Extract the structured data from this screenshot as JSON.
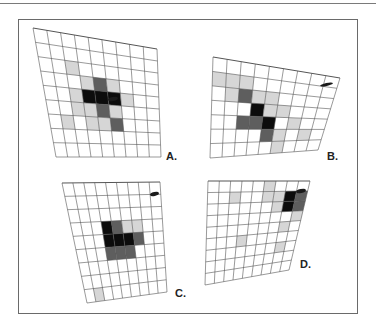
{
  "figure": {
    "panels": [
      {
        "id": "A",
        "label": "A.",
        "cols": 9,
        "rows": 9,
        "corners": {
          "tl": [
            33,
            28
          ],
          "tr": [
            157,
            49
          ],
          "br": [
            161,
            157
          ],
          "bl": [
            56,
            157
          ]
        },
        "label_pos": [
          166,
          150
        ],
        "cells": [
          [
            2,
            2,
            1
          ],
          [
            3,
            3,
            1
          ],
          [
            3,
            4,
            2
          ],
          [
            3,
            5,
            1
          ],
          [
            4,
            2,
            1
          ],
          [
            4,
            3,
            3
          ],
          [
            4,
            4,
            3
          ],
          [
            4,
            5,
            3
          ],
          [
            4,
            6,
            1
          ],
          [
            5,
            2,
            1
          ],
          [
            5,
            3,
            1
          ],
          [
            5,
            4,
            2
          ],
          [
            5,
            5,
            1
          ],
          [
            6,
            1,
            1
          ],
          [
            6,
            3,
            1
          ],
          [
            6,
            4,
            1
          ],
          [
            6,
            5,
            2
          ]
        ],
        "marker": {
          "x": 108,
          "y": 97,
          "w": 10,
          "h": 4
        }
      },
      {
        "id": "B",
        "label": "B.",
        "cols": 9,
        "rows": 7,
        "corners": {
          "tl": [
            213,
            57
          ],
          "tr": [
            340,
            78
          ],
          "br": [
            318,
            150
          ],
          "bl": [
            210,
            158
          ]
        },
        "label_pos": [
          327,
          150
        ],
        "cells": [
          [
            1,
            0,
            1
          ],
          [
            1,
            1,
            1
          ],
          [
            1,
            2,
            1
          ],
          [
            2,
            1,
            1
          ],
          [
            2,
            2,
            2
          ],
          [
            2,
            3,
            1
          ],
          [
            2,
            4,
            1
          ],
          [
            3,
            3,
            3
          ],
          [
            3,
            4,
            1
          ],
          [
            3,
            5,
            1
          ],
          [
            4,
            2,
            2
          ],
          [
            4,
            3,
            2
          ],
          [
            4,
            4,
            3
          ],
          [
            4,
            6,
            1
          ],
          [
            5,
            4,
            2
          ],
          [
            5,
            5,
            1
          ],
          [
            5,
            7,
            1
          ],
          [
            6,
            5,
            1
          ]
        ],
        "marker": {
          "x": 320,
          "y": 83,
          "w": 13,
          "h": 3
        }
      },
      {
        "id": "C",
        "label": "C.",
        "cols": 9,
        "rows": 9,
        "corners": {
          "tl": [
            62,
            183
          ],
          "tr": [
            160,
            182
          ],
          "br": [
            167,
            292
          ],
          "bl": [
            87,
            303
          ]
        },
        "label_pos": [
          175,
          287
        ],
        "cells": [
          [
            3,
            3,
            3
          ],
          [
            3,
            4,
            2
          ],
          [
            3,
            5,
            1
          ],
          [
            3,
            6,
            1
          ],
          [
            4,
            3,
            3
          ],
          [
            4,
            4,
            3
          ],
          [
            4,
            5,
            3
          ],
          [
            4,
            6,
            2
          ],
          [
            5,
            3,
            2
          ],
          [
            5,
            4,
            2
          ],
          [
            5,
            5,
            2
          ],
          [
            8,
            1,
            1
          ]
        ],
        "marker": {
          "x": 150,
          "y": 192,
          "w": 9,
          "h": 4
        }
      },
      {
        "id": "D",
        "label": "D.",
        "cols": 9,
        "rows": 9,
        "corners": {
          "tl": [
            208,
            181
          ],
          "tr": [
            310,
            181
          ],
          "br": [
            289,
            270
          ],
          "bl": [
            205,
            285
          ]
        },
        "label_pos": [
          300,
          258
        ],
        "cells": [
          [
            0,
            5,
            1
          ],
          [
            1,
            2,
            1
          ],
          [
            1,
            5,
            1
          ],
          [
            1,
            6,
            1
          ],
          [
            1,
            7,
            3
          ],
          [
            1,
            8,
            2
          ],
          [
            2,
            6,
            1
          ],
          [
            2,
            7,
            3
          ],
          [
            2,
            8,
            2
          ],
          [
            3,
            8,
            1
          ],
          [
            4,
            7,
            1
          ],
          [
            5,
            3,
            1
          ],
          [
            6,
            7,
            1
          ]
        ],
        "marker": {
          "x": 296,
          "y": 189,
          "w": 10,
          "h": 4
        }
      }
    ],
    "shade_levels": {
      "0": "#ffffff",
      "1": "#d6d6d6",
      "2": "#5e5e5e",
      "3": "#0c0c0c"
    },
    "grid_line_color": "#555555"
  }
}
